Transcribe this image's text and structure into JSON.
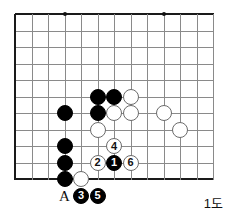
{
  "diagram": {
    "caption": "1도",
    "type": "go-board",
    "grid": {
      "origin_x": 15,
      "origin_y": 14,
      "spacing": 16.5,
      "cols": 13,
      "rows": 11,
      "edges": [
        "left",
        "top",
        "bottom"
      ],
      "line_color": "#8a8a8a",
      "edge_color": "#1a1a1a"
    },
    "star_points": [
      {
        "col": 3,
        "row": 0
      },
      {
        "col": 9,
        "row": 0
      }
    ],
    "stone_radius": 8,
    "stones": [
      {
        "col": 3,
        "row": 6,
        "color": "black",
        "label": ""
      },
      {
        "col": 3,
        "row": 8,
        "color": "black",
        "label": ""
      },
      {
        "col": 3,
        "row": 9,
        "color": "black",
        "label": ""
      },
      {
        "col": 3,
        "row": 10,
        "color": "black",
        "label": ""
      },
      {
        "col": 5,
        "row": 5,
        "color": "black",
        "label": ""
      },
      {
        "col": 6,
        "row": 5,
        "color": "black",
        "label": ""
      },
      {
        "col": 5,
        "row": 6,
        "color": "black",
        "label": ""
      },
      {
        "col": 7,
        "row": 5,
        "color": "white",
        "label": ""
      },
      {
        "col": 6,
        "row": 6,
        "color": "white",
        "label": ""
      },
      {
        "col": 7,
        "row": 6,
        "color": "white",
        "label": ""
      },
      {
        "col": 5,
        "row": 7,
        "color": "white",
        "label": ""
      },
      {
        "col": 4,
        "row": 10,
        "color": "white",
        "label": ""
      },
      {
        "col": 9,
        "row": 6,
        "color": "white",
        "label": ""
      },
      {
        "col": 10,
        "row": 7,
        "color": "white",
        "label": ""
      },
      {
        "col": 6,
        "row": 9,
        "color": "black",
        "label": "1"
      },
      {
        "col": 5,
        "row": 9,
        "color": "white",
        "label": "2"
      },
      {
        "col": 4,
        "row": 11,
        "color": "black",
        "label": "3"
      },
      {
        "col": 6,
        "row": 8,
        "color": "white",
        "label": "4"
      },
      {
        "col": 5,
        "row": 11,
        "color": "black",
        "label": "5"
      },
      {
        "col": 7,
        "row": 9,
        "color": "white",
        "label": "6"
      }
    ],
    "point_labels": [
      {
        "col": 3,
        "row": 11,
        "text": "A"
      }
    ]
  }
}
